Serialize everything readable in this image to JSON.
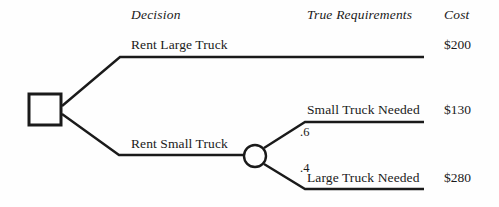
{
  "diagram": {
    "type": "decision-tree",
    "headers": {
      "decision": "Decision",
      "true_requirements": "True Requirements",
      "cost": "Cost"
    },
    "nodes": {
      "decision_node": "decision-square",
      "chance_node": "chance-circle"
    },
    "branches": {
      "rent_large_truck": "Rent Large Truck",
      "rent_small_truck": "Rent Small Truck"
    },
    "outcomes": {
      "small_truck_needed": "Small Truck Needed",
      "large_truck_needed": "Large Truck Needed"
    },
    "probabilities": {
      "small_truck_needed": ".6",
      "large_truck_needed": ".4"
    },
    "costs": {
      "rent_large_truck": "$200",
      "small_truck_needed": "$130",
      "large_truck_needed": "$280"
    },
    "colors": {
      "ink": "#1a1a1a",
      "background": "#fefefe"
    }
  }
}
